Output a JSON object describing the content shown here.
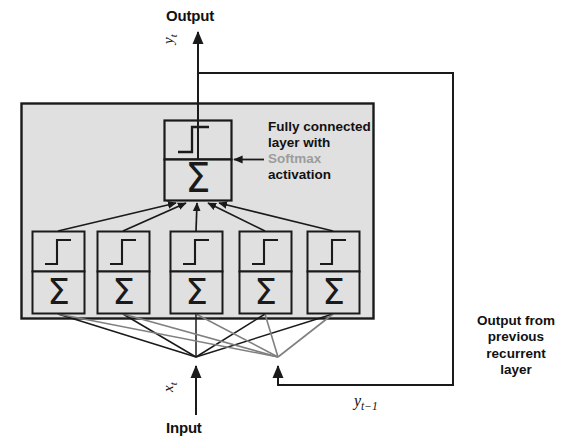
{
  "diagram": {
    "title_labels": {
      "output": "Output",
      "input": "Input"
    },
    "math_labels": {
      "y_t": "y",
      "y_t_sub": "t",
      "x_t": "x",
      "x_t_sub": "t",
      "y_prev": "y",
      "y_prev_sub": "t−1"
    },
    "annotations": {
      "fully_connected_line1": "Fully connected",
      "fully_connected_line2": "layer with",
      "fully_connected_softmax": "Softmax",
      "fully_connected_line4": "activation",
      "recurrent_line1": "Output from",
      "recurrent_line2": "previous",
      "recurrent_line3": "recurrent",
      "recurrent_line4": "layer"
    },
    "neuron_glyphs": {
      "activation": "step-function",
      "summation": "Σ"
    },
    "layer_panel": {
      "fill_color": "#e0e0e0",
      "stroke_color": "#1a1a1a"
    },
    "colors": {
      "line_black": "#1a1a1a",
      "line_gray": "#808080",
      "softmax_text": "#9c9c9c",
      "panel_fill": "#e0e0e0",
      "box_fill": "#e0e0e0",
      "text": "#111111"
    },
    "hidden_units_count": 5,
    "output_units_count": 1,
    "fanout_points": {
      "input_x": 196,
      "recurrent_x": 278,
      "y": 357
    }
  }
}
